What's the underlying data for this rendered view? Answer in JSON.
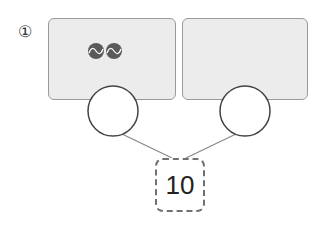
{
  "problem": {
    "number_label": "①",
    "total": "10",
    "left_box": {
      "ball_count": 2,
      "ball_icon": "tennis-ball-icon"
    },
    "right_box": {
      "ball_count": 0
    },
    "left_circle_value": "",
    "right_circle_value": ""
  },
  "colors": {
    "box_fill": "#ececec",
    "box_border": "#9a9a9a",
    "ball": "#5a5a5a",
    "line": "#888888"
  }
}
